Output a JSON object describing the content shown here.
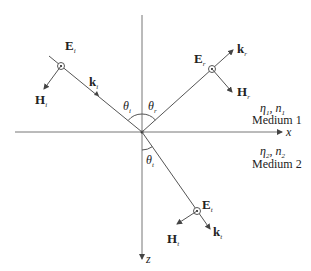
{
  "diagram": {
    "axes": {
      "x_label": "x",
      "z_label": "z"
    },
    "incident": {
      "E_label": "E",
      "E_sub": "i",
      "H_label": "H",
      "H_sub": "i",
      "k_label": "k",
      "k_sub": "i",
      "theta_label": "θ",
      "theta_sub": "i"
    },
    "reflected": {
      "E_label": "E",
      "E_sub": "r",
      "H_label": "H",
      "H_sub": "r",
      "k_label": "k",
      "k_sub": "r",
      "theta_label": "θ",
      "theta_sub": "r"
    },
    "transmitted": {
      "E_label": "E",
      "E_sub": "t",
      "H_label": "H",
      "H_sub": "t",
      "k_label": "k",
      "k_sub": "t",
      "theta_label": "θ",
      "theta_sub": "t"
    },
    "medium1": {
      "params": "η",
      "eta_sub": "1",
      "n_label": "n",
      "n_sub": "1",
      "name": "Medium 1"
    },
    "medium2": {
      "params": "η",
      "eta_sub": "2",
      "n_label": "n",
      "n_sub": "2",
      "name": "Medium 2"
    },
    "colors": {
      "line": "#555555",
      "text": "#222222",
      "background": "#ffffff"
    }
  }
}
